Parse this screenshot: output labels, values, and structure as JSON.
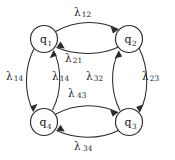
{
  "diagram": {
    "type": "state-transition-graph",
    "background_color": "#ffffff",
    "stroke_color": "#2b2b2b",
    "text_color": "#1a1a1a",
    "nodes": [
      {
        "id": "q1",
        "label": "q",
        "subscript": "1",
        "cx": 44,
        "cy": 39,
        "r": 13.5
      },
      {
        "id": "q2",
        "label": "q",
        "subscript": "2",
        "cx": 129,
        "cy": 39,
        "r": 13.5
      },
      {
        "id": "q3",
        "label": "q",
        "subscript": "3",
        "cx": 129,
        "cy": 122,
        "r": 13.5
      },
      {
        "id": "q4",
        "label": "q",
        "subscript": "4",
        "cx": 44,
        "cy": 122,
        "r": 13.5
      }
    ],
    "edges": [
      {
        "id": "e12",
        "from": "q1",
        "to": "q2",
        "lambda": "λ",
        "sub": "12",
        "label_x": 74,
        "label_y": 7
      },
      {
        "id": "e21",
        "from": "q2",
        "to": "q1",
        "lambda": "λ",
        "sub": "21",
        "label_x": 65,
        "label_y": 53
      },
      {
        "id": "e23",
        "from": "q2",
        "to": "q3",
        "lambda": "λ",
        "sub": "23",
        "label_x": 142,
        "label_y": 71
      },
      {
        "id": "e32",
        "from": "q3",
        "to": "q2",
        "lambda": "λ",
        "sub": "32",
        "label_x": 86,
        "label_y": 71
      },
      {
        "id": "e34",
        "from": "q3",
        "to": "q4",
        "lambda": "λ",
        "sub": "34",
        "label_x": 74,
        "label_y": 141
      },
      {
        "id": "e43",
        "from": "q4",
        "to": "q3",
        "lambda": "λ",
        "sub": "43",
        "label_x": 68,
        "label_y": 88
      },
      {
        "id": "e14",
        "from": "q1",
        "to": "q4",
        "lambda": "λ",
        "sub": "14",
        "label_x": 6,
        "label_y": 71
      },
      {
        "id": "e41",
        "from": "q4",
        "to": "q1",
        "lambda": "λ",
        "sub": "14",
        "label_x": 52,
        "label_y": 71
      }
    ]
  }
}
